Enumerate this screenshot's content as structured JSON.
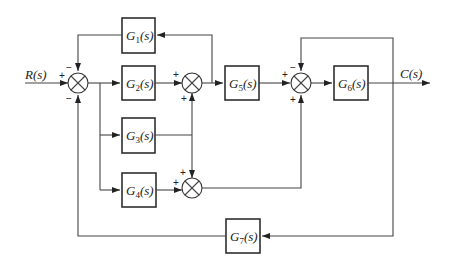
{
  "diagram": {
    "type": "control-system-block-diagram",
    "input": {
      "label": "R(s)"
    },
    "output": {
      "label": "C(s)"
    },
    "blocks": [
      {
        "id": "G1",
        "label": "G",
        "sub": "1",
        "suffix": "(s)"
      },
      {
        "id": "G2",
        "label": "G",
        "sub": "2",
        "suffix": "(s)"
      },
      {
        "id": "G3",
        "label": "G",
        "sub": "3",
        "suffix": "(s)"
      },
      {
        "id": "G4",
        "label": "G",
        "sub": "4",
        "suffix": "(s)"
      },
      {
        "id": "G5",
        "label": "G",
        "sub": "5",
        "suffix": "(s)"
      },
      {
        "id": "G6",
        "label": "G",
        "sub": "6",
        "suffix": "(s)"
      },
      {
        "id": "G7",
        "label": "G",
        "sub": "7",
        "suffix": "(s)"
      }
    ],
    "summing_junctions": [
      {
        "id": "S1",
        "signs": {
          "left": "+",
          "top": "−",
          "bottom": "−"
        }
      },
      {
        "id": "S2",
        "signs": {
          "left": "+",
          "bottom": "+"
        }
      },
      {
        "id": "S3",
        "signs": {
          "left": "+",
          "top": "+"
        }
      },
      {
        "id": "S4",
        "signs": {
          "left": "+",
          "top": "−",
          "bottom": "+"
        }
      }
    ],
    "connections": [
      "R(s) -> S1 (+)",
      "S1 -> G2, G3, G4",
      "G2 -> S2 (+)",
      "G3 -> S2 (+) and S3 (+)",
      "G4 -> S3 (+)",
      "S2 -> G5",
      "S2 output -> G1 -> S1 (−)",
      "G5 -> S4 (+)",
      "S3 -> S4 (+)",
      "S4 -> G6 -> C(s)",
      "C(s) -> S4 (−)",
      "C(s) -> G7 -> S1 (−)"
    ]
  }
}
